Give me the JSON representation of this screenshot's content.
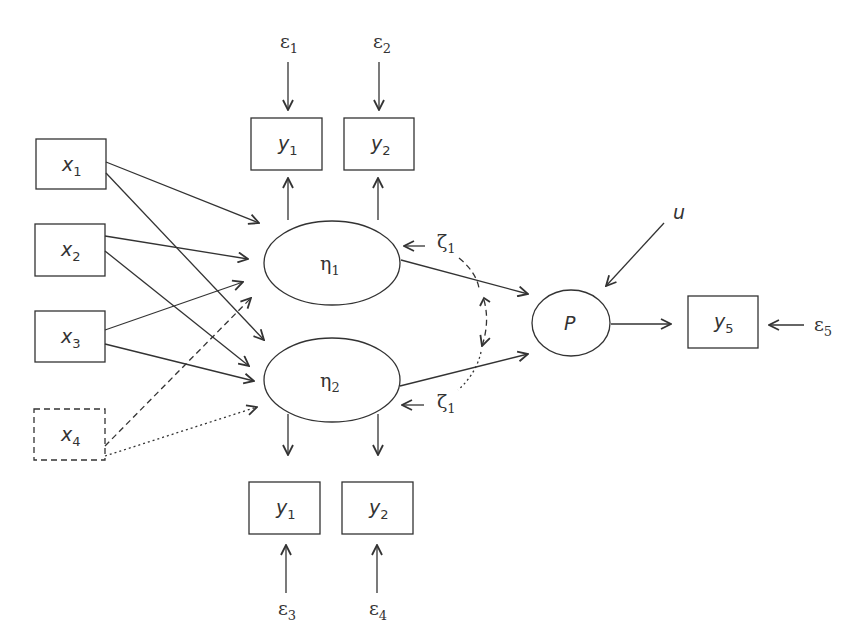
{
  "diagram": {
    "type": "structural-equation-model path diagram",
    "colors": {
      "stroke": "#333333",
      "background": "#ffffff"
    },
    "exogenous": [
      {
        "id": "x1",
        "base": "x",
        "sub": "1",
        "style": "solid"
      },
      {
        "id": "x2",
        "base": "x",
        "sub": "2",
        "style": "solid"
      },
      {
        "id": "x3",
        "base": "x",
        "sub": "3",
        "style": "solid"
      },
      {
        "id": "x4",
        "base": "x",
        "sub": "4",
        "style": "dashed"
      }
    ],
    "latent": [
      {
        "id": "eta1",
        "base": "η",
        "sub": "1"
      },
      {
        "id": "eta2",
        "base": "η",
        "sub": "2"
      },
      {
        "id": "P",
        "base": "P",
        "sub": ""
      }
    ],
    "indicators_top": [
      {
        "id": "y1_top",
        "base": "y",
        "sub": "1",
        "error_base": "ε",
        "error_sub": "1"
      },
      {
        "id": "y2_top",
        "base": "y",
        "sub": "2",
        "error_base": "ε",
        "error_sub": "2"
      }
    ],
    "indicators_bottom": [
      {
        "id": "y1_bot",
        "base": "y",
        "sub": "1",
        "error_base": "ε",
        "error_sub": "3"
      },
      {
        "id": "y2_bot",
        "base": "y",
        "sub": "2",
        "error_base": "ε",
        "error_sub": "4"
      }
    ],
    "outcome": {
      "id": "y5",
      "base": "y",
      "sub": "5",
      "error_base": "ε",
      "error_sub": "5"
    },
    "disturbances": [
      {
        "target": "eta1",
        "base": "ζ",
        "sub": "1"
      },
      {
        "target": "eta2",
        "base": "ζ",
        "sub": "1"
      },
      {
        "target": "P",
        "base": "u",
        "sub": ""
      }
    ],
    "paths": [
      {
        "from": "x1",
        "to": "eta1",
        "style": "solid"
      },
      {
        "from": "x1",
        "to": "eta2",
        "style": "solid"
      },
      {
        "from": "x2",
        "to": "eta1",
        "style": "solid"
      },
      {
        "from": "x2",
        "to": "eta2",
        "style": "solid"
      },
      {
        "from": "x3",
        "to": "eta1",
        "style": "solid"
      },
      {
        "from": "x3",
        "to": "eta2",
        "style": "solid"
      },
      {
        "from": "x4",
        "to": "eta1",
        "style": "dashed"
      },
      {
        "from": "x4",
        "to": "eta2",
        "style": "dotted"
      },
      {
        "from": "eta1",
        "to": "y1_top",
        "style": "solid"
      },
      {
        "from": "eta1",
        "to": "y2_top",
        "style": "solid"
      },
      {
        "from": "eta2",
        "to": "y1_bot",
        "style": "solid"
      },
      {
        "from": "eta2",
        "to": "y2_bot",
        "style": "solid"
      },
      {
        "from": "eta1",
        "to": "P",
        "style": "solid"
      },
      {
        "from": "eta2",
        "to": "P",
        "style": "solid"
      },
      {
        "from": "P",
        "to": "y5",
        "style": "solid"
      },
      {
        "from": "zeta1",
        "to": "zeta2",
        "style": "dashed-curved-bidirectional"
      }
    ]
  }
}
